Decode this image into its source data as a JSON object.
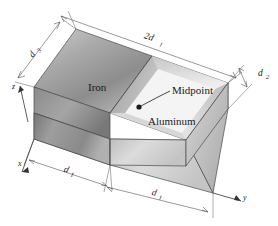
{
  "figure": {
    "type": "isometric-composite-block-diagram",
    "materials": [
      {
        "id": "iron",
        "label": "Iron",
        "fill": "#9a9a9a"
      },
      {
        "id": "aluminum",
        "label": "Aluminum",
        "fill": "#e6e6e6"
      }
    ],
    "annotations": {
      "midpoint_label": "Midpoint",
      "midpoint_marker": "midpoint-dot"
    },
    "dimensions": [
      {
        "id": "top-length",
        "base": "2d",
        "sub": "1",
        "text": "2d1",
        "position": "top-edge"
      },
      {
        "id": "front-left-length",
        "base": "d",
        "sub": "1",
        "text": "d1",
        "position": "front-lower-left"
      },
      {
        "id": "front-right-length",
        "base": "d",
        "sub": "1",
        "text": "d1",
        "position": "front-lower-right"
      },
      {
        "id": "thickness",
        "base": "d",
        "sub": "2",
        "text": "d2",
        "position": "right-edge"
      },
      {
        "id": "depth",
        "base": "d",
        "sub": "3",
        "text": "d3",
        "position": "upper-left-edge"
      }
    ],
    "axes": [
      {
        "id": "x-axis",
        "label": "x"
      },
      {
        "id": "y-axis",
        "label": "y"
      },
      {
        "id": "z-axis",
        "label": "z"
      }
    ],
    "colors": {
      "outline": "#3a3a3a",
      "dimension_line": "#555555",
      "text": "#1a1a1a",
      "background": "#ffffff"
    }
  }
}
